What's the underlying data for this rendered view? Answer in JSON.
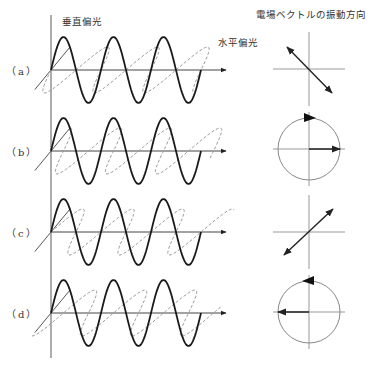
{
  "labels": {
    "vertical_polarization": "垂直偏光",
    "horizontal_polarization": "水平偏光",
    "vector_title": "電場ベクトルの振動方向"
  },
  "colors": {
    "solid_wave": "#1a1a1a",
    "dashed_wave": "#9a9a9a",
    "axis": "#777777",
    "vector": "#222222",
    "circle": "#888888"
  },
  "geometry": {
    "axis_x": 51,
    "axis_top": 15,
    "axis_bottom": 358,
    "wave_period": 50,
    "wave_cycles": 3,
    "amplitude": 33,
    "depth_dx": 19,
    "depth_dy": -23,
    "arrow_end_x": 226,
    "vector_center_x": 309,
    "circle_radius": 31
  },
  "rows": [
    {
      "id": "a",
      "label": "（a）",
      "baseline": 70,
      "polarization": "linear",
      "h_phase": "neg_sin",
      "vector_dir": "upper-left to lower-right",
      "center_y": 69
    },
    {
      "id": "b",
      "label": "（b）",
      "baseline": 151,
      "polarization": "circular",
      "h_phase": "cos",
      "rotation": "clockwise",
      "vector_dir": "right",
      "center_y": 149
    },
    {
      "id": "c",
      "label": "（c）",
      "baseline": 232,
      "polarization": "linear",
      "h_phase": "sin",
      "vector_dir": "lower-left to upper-right",
      "center_y": 232
    },
    {
      "id": "d",
      "label": "（d）",
      "baseline": 313,
      "polarization": "circular",
      "h_phase": "neg_cos",
      "rotation": "counterclockwise",
      "vector_dir": "left",
      "center_y": 312
    }
  ]
}
